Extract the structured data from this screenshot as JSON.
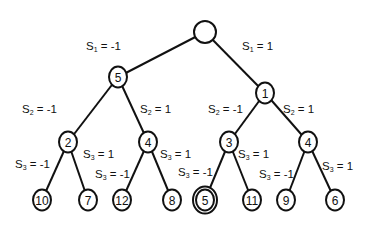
{
  "diagram": {
    "type": "decision-tree",
    "nodes": [
      {
        "id": "root",
        "value": "",
        "double": false
      },
      {
        "id": "n5",
        "value": "5",
        "double": false
      },
      {
        "id": "n1",
        "value": "1",
        "double": false
      },
      {
        "id": "n2",
        "value": "2",
        "double": false
      },
      {
        "id": "n4a",
        "value": "4",
        "double": false
      },
      {
        "id": "n3",
        "value": "3",
        "double": false
      },
      {
        "id": "n4b",
        "value": "4",
        "double": false
      },
      {
        "id": "l10",
        "value": "10",
        "double": false
      },
      {
        "id": "l7",
        "value": "7",
        "double": false
      },
      {
        "id": "l12",
        "value": "12",
        "double": false
      },
      {
        "id": "l8",
        "value": "8",
        "double": false
      },
      {
        "id": "l5",
        "value": "5",
        "double": true
      },
      {
        "id": "l11",
        "value": "11",
        "double": false
      },
      {
        "id": "l9",
        "value": "9",
        "double": false
      },
      {
        "id": "l6",
        "value": "6",
        "double": false
      }
    ],
    "edges": [
      {
        "from": "root",
        "to": "n5",
        "var": "S",
        "sub": "1",
        "val": "-1"
      },
      {
        "from": "root",
        "to": "n1",
        "var": "S",
        "sub": "1",
        "val": "1"
      },
      {
        "from": "n5",
        "to": "n2",
        "var": "S",
        "sub": "2",
        "val": "-1"
      },
      {
        "from": "n5",
        "to": "n4a",
        "var": "S",
        "sub": "2",
        "val": "1"
      },
      {
        "from": "n1",
        "to": "n3",
        "var": "S",
        "sub": "2",
        "val": "-1"
      },
      {
        "from": "n1",
        "to": "n4b",
        "var": "S",
        "sub": "2",
        "val": "1"
      },
      {
        "from": "n2",
        "to": "l10",
        "var": "S",
        "sub": "3",
        "val": "-1"
      },
      {
        "from": "n2",
        "to": "l7",
        "var": "S",
        "sub": "3",
        "val": "1"
      },
      {
        "from": "n4a",
        "to": "l12",
        "var": "S",
        "sub": "3",
        "val": "-1"
      },
      {
        "from": "n4a",
        "to": "l8",
        "var": "S",
        "sub": "3",
        "val": "1"
      },
      {
        "from": "n3",
        "to": "l5",
        "var": "S",
        "sub": "3",
        "val": "-1"
      },
      {
        "from": "n3",
        "to": "l11",
        "var": "S",
        "sub": "3",
        "val": "1"
      },
      {
        "from": "n4b",
        "to": "l9",
        "var": "S",
        "sub": "3",
        "val": "-1"
      },
      {
        "from": "n4b",
        "to": "l6",
        "var": "S",
        "sub": "3",
        "val": "1"
      }
    ]
  }
}
